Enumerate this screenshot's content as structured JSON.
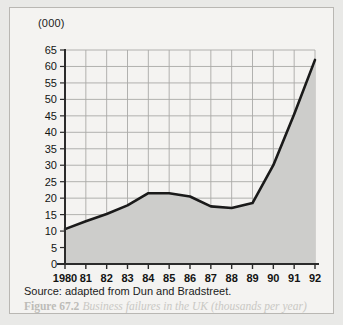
{
  "figure": {
    "y_unit_label": "(000)",
    "source_note": "Source: adapted from Dun and Bradstreet.",
    "caption_label": "Figure 67.2",
    "caption_text": "Business failures in the UK (thousands per year)"
  },
  "colors": {
    "page_background": "#e9e9e7",
    "card_background": "#f4f3f1",
    "card_border": "#b9b7b3",
    "area_fill": "#cdcdcb",
    "line": "#1a1a1a",
    "axis": "#2b2b2b",
    "grid": "#a9a9a7",
    "tick_text": "#131313",
    "caption_text": "#c6c5c1"
  },
  "chart_data": {
    "type": "area",
    "title": "Business failures in the UK (thousands per year)",
    "xlabel": "",
    "ylabel": "(000)",
    "ylim": [
      0,
      65
    ],
    "xlim": [
      1980,
      1992
    ],
    "grid": true,
    "legend": "none",
    "ytick_labels": [
      "65",
      "60",
      "55",
      "50",
      "45",
      "40",
      "35",
      "30",
      "25",
      "20",
      "15",
      "10",
      "5",
      "0"
    ],
    "ytick_values": [
      65,
      60,
      55,
      50,
      45,
      40,
      35,
      30,
      25,
      20,
      15,
      10,
      5,
      0
    ],
    "xtick_labels": [
      "1980",
      "81",
      "82",
      "83",
      "84",
      "85",
      "86",
      "87",
      "88",
      "89",
      "90",
      "91",
      "92"
    ],
    "x": [
      1980,
      1981,
      1982,
      1983,
      1984,
      1985,
      1986,
      1987,
      1988,
      1989,
      1990,
      1991,
      1992
    ],
    "series": [
      {
        "name": "Business failures",
        "values": [
          10.6,
          13.0,
          15.2,
          17.8,
          21.5,
          21.5,
          20.5,
          17.5,
          17.0,
          18.5,
          30.0,
          45.5,
          62.0
        ]
      }
    ]
  }
}
